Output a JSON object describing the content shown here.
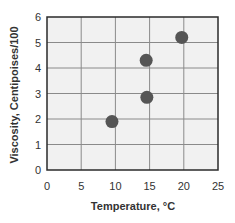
{
  "chart_data": {
    "type": "scatter",
    "title": "",
    "xlabel": "Temperature, °C",
    "ylabel": "Viscosity, Centipoises/100",
    "xlim": [
      0,
      25
    ],
    "ylim": [
      0,
      6
    ],
    "xticks": [
      0,
      5,
      10,
      15,
      20,
      25
    ],
    "yticks": [
      0,
      1,
      2,
      3,
      4,
      5,
      6
    ],
    "grid": true,
    "legend": null,
    "points": [
      {
        "x": 9.5,
        "y": 1.9
      },
      {
        "x": 14.6,
        "y": 2.85
      },
      {
        "x": 14.5,
        "y": 4.3
      },
      {
        "x": 19.7,
        "y": 5.2
      }
    ],
    "colors": {
      "marker": "#555555",
      "grid": "#8a8a8a",
      "plot_bg": "#f1f1f1",
      "frame": "#2a2a2a",
      "text": "#333333"
    }
  }
}
